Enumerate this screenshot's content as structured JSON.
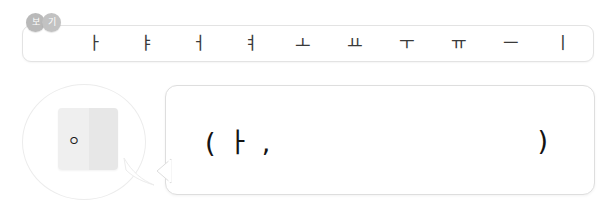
{
  "background_color": "#ffffff",
  "view_badges": {
    "name": "view-badges",
    "items": [
      {
        "label": "보",
        "color": "#b9b9b9"
      },
      {
        "label": "기",
        "color": "#c2c2c2"
      }
    ]
  },
  "vowel_toolbar": {
    "name": "korean-vowel-toolbar",
    "keys": [
      {
        "label": "ㅏ"
      },
      {
        "label": "ㅑ"
      },
      {
        "label": "ㅓ"
      },
      {
        "label": "ㅕ"
      },
      {
        "label": "ㅗ"
      },
      {
        "label": "ㅛ"
      },
      {
        "label": "ㅜ"
      },
      {
        "label": "ㅠ"
      },
      {
        "label": "ㅡ"
      },
      {
        "label": "ㅣ"
      }
    ]
  },
  "prompt_bubble": {
    "name": "consonant-prompt-bubble",
    "card": {
      "consonant": "ㅇ",
      "left_panel_color": "#efefef",
      "right_panel_color": "#e7e7e7"
    }
  },
  "answer_box": {
    "name": "answer-input-box",
    "prefix_text": "( ㅏ ,",
    "suffix_text": ")",
    "text_color": "#141414"
  }
}
